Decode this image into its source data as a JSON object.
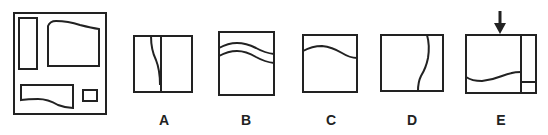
{
  "figure": {
    "stroke_color": "#222222",
    "background": "#ffffff",
    "options": [
      {
        "label": "A"
      },
      {
        "label": "B"
      },
      {
        "label": "C"
      },
      {
        "label": "D"
      },
      {
        "label": "E"
      }
    ],
    "arrow_indicator": "down-arrow-icon above option E"
  }
}
